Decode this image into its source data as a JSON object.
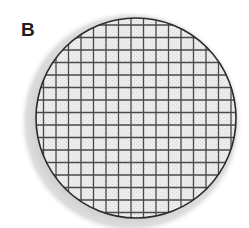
{
  "figure": {
    "panel_label": "B",
    "colors": {
      "background": "#ffffff",
      "halo": "#d6d6d6",
      "disc_fill": "#eeeeee",
      "grid_line": "#4a4a4a",
      "disc_border": "#2a2a2a",
      "label": "#1e1e1e"
    },
    "disc": {
      "center_x": 136,
      "center_y": 118,
      "radius": 100
    },
    "grid": {
      "spacing_px": 12.5,
      "vertical_lines": 16,
      "horizontal_lines": 16
    }
  }
}
